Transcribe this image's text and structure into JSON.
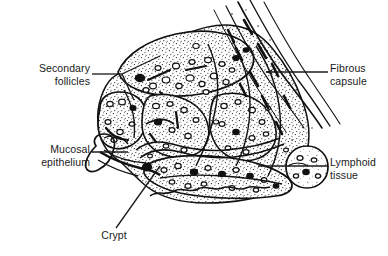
{
  "figure": {
    "width": 388,
    "height": 256,
    "background_color": "#ffffff",
    "ink_color": "#000000",
    "style": "black-and-white stippled line drawing"
  },
  "labels": [
    {
      "id": "secondary-follicles",
      "text": "Secondary\nfollicles",
      "align": "right",
      "leader": "forked line from text to two points on upper-left follicles"
    },
    {
      "id": "mucosal-epithelium",
      "text": "Mucosal\nepithelium",
      "align": "right",
      "leader": "horizontal line to epithelial fold at left"
    },
    {
      "id": "crypt",
      "text": "Crypt",
      "align": "center",
      "leader": "diagonal line rising to the crypt invagination"
    },
    {
      "id": "fibrous-capsule",
      "text": "Fibrous\ncapsule",
      "align": "left",
      "leader": "horizontal arrow pointing left into the fibrous band"
    },
    {
      "id": "lymphoid-tissue",
      "text": "Lymphoid\ntissue",
      "align": "left",
      "leader": "horizontal line running left into the lymphoid nodule"
    }
  ]
}
